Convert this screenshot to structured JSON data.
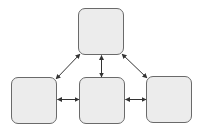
{
  "diagram": {
    "type": "node-link",
    "colors": {
      "node_fill": "#ececec",
      "node_border": "#6a6a6a",
      "arrow": "#333333",
      "background": "#ffffff"
    },
    "nodes": [
      {
        "id": "top",
        "label": "",
        "x": 78,
        "y": 8,
        "w": 46,
        "h": 47
      },
      {
        "id": "left",
        "label": "",
        "x": 11,
        "y": 77,
        "w": 46,
        "h": 47
      },
      {
        "id": "center",
        "label": "",
        "x": 79,
        "y": 77,
        "w": 46,
        "h": 47
      },
      {
        "id": "right",
        "label": "",
        "x": 146,
        "y": 76,
        "w": 46,
        "h": 47
      }
    ],
    "edges": [
      {
        "from": "top",
        "to": "left",
        "direction": "bidirectional"
      },
      {
        "from": "top",
        "to": "center",
        "direction": "bidirectional"
      },
      {
        "from": "top",
        "to": "right",
        "direction": "bidirectional"
      },
      {
        "from": "left",
        "to": "center",
        "direction": "bidirectional"
      },
      {
        "from": "center",
        "to": "right",
        "direction": "bidirectional"
      }
    ]
  }
}
